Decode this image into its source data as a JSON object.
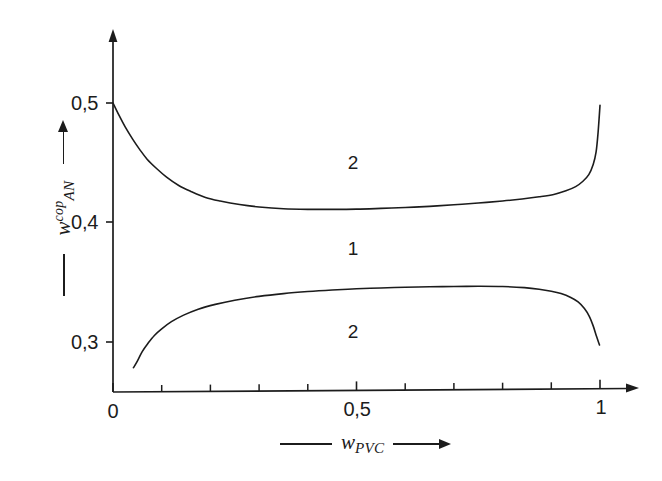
{
  "chart_data": {
    "type": "line",
    "title": "",
    "subtitle": "",
    "xlabel": "w_PVC",
    "ylabel": "w_AN^cop",
    "xlabel_parts": {
      "symbol": "w",
      "sub": "PVC",
      "sup": ""
    },
    "ylabel_parts": {
      "symbol": "w",
      "sub": "AN",
      "sup": "cop"
    },
    "xlim": [
      0,
      1
    ],
    "ylim": [
      0.25,
      0.545
    ],
    "grid": false,
    "legend": "none",
    "x_ticks": [
      0,
      0.1,
      0.2,
      0.3,
      0.4,
      0.5,
      0.6,
      0.7,
      0.8,
      0.9,
      1
    ],
    "x_tick_labels": [
      "0",
      "",
      "",
      "",
      "",
      "0,5",
      "",
      "",
      "",
      "",
      "1"
    ],
    "y_ticks": [
      0.3,
      0.4,
      0.5
    ],
    "y_tick_labels": [
      "0,3",
      "0,4",
      "0,5"
    ],
    "axis_arrows": {
      "x": true,
      "y": true
    },
    "series": [
      {
        "name": "upper-boundary",
        "comment": "upper cloud-point branch",
        "x": [
          0.0,
          0.012,
          0.025,
          0.04,
          0.055,
          0.07,
          0.09,
          0.11,
          0.135,
          0.16,
          0.19,
          0.22,
          0.26,
          0.3,
          0.35,
          0.4,
          0.45,
          0.5,
          0.55,
          0.6,
          0.65,
          0.7,
          0.75,
          0.8,
          0.84,
          0.875,
          0.905,
          0.93,
          0.95,
          0.965,
          0.977,
          0.986,
          0.992,
          0.996,
          1.0
        ],
        "values": [
          0.5,
          0.49,
          0.48,
          0.47,
          0.461,
          0.453,
          0.445,
          0.438,
          0.431,
          0.426,
          0.421,
          0.418,
          0.415,
          0.413,
          0.4115,
          0.411,
          0.411,
          0.4112,
          0.4118,
          0.4125,
          0.4135,
          0.4148,
          0.4163,
          0.418,
          0.4197,
          0.4215,
          0.4235,
          0.4265,
          0.43,
          0.4345,
          0.44,
          0.4485,
          0.459,
          0.475,
          0.498
        ]
      },
      {
        "name": "lower-boundary",
        "comment": "lower cloud-point branch",
        "x": [
          0.042,
          0.05,
          0.06,
          0.072,
          0.085,
          0.1,
          0.12,
          0.145,
          0.175,
          0.21,
          0.25,
          0.3,
          0.35,
          0.4,
          0.45,
          0.5,
          0.55,
          0.6,
          0.65,
          0.7,
          0.75,
          0.8,
          0.845,
          0.875,
          0.9,
          0.92,
          0.94,
          0.955,
          0.968,
          0.978,
          0.986,
          0.993,
          0.999
        ],
        "values": [
          0.2785,
          0.284,
          0.292,
          0.299,
          0.3055,
          0.311,
          0.317,
          0.3225,
          0.3275,
          0.3315,
          0.335,
          0.3382,
          0.3405,
          0.3422,
          0.3435,
          0.3445,
          0.3452,
          0.3458,
          0.3462,
          0.3465,
          0.3466,
          0.3464,
          0.3455,
          0.3442,
          0.3425,
          0.3405,
          0.3372,
          0.3335,
          0.328,
          0.3215,
          0.3135,
          0.3045,
          0.2975
        ]
      }
    ],
    "annotations": [
      {
        "text": "2",
        "x": 0.49,
        "y": 0.4505,
        "region": "above-upper-curve"
      },
      {
        "text": "1",
        "x": 0.49,
        "y": 0.3785,
        "region": "between-curves"
      },
      {
        "text": "2",
        "x": 0.49,
        "y": 0.3095,
        "region": "below-lower-curve"
      }
    ],
    "colors": {
      "curve": "#1c1c1c",
      "axis": "#1c1c1c",
      "text": "#1c1c1c",
      "background": "#ffffff"
    }
  }
}
